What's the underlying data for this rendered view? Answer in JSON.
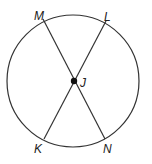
{
  "diagram": {
    "type": "circle-with-intersecting-chords",
    "circle": {
      "cx": 73,
      "cy": 81,
      "r": 66
    },
    "center_point": {
      "label": "J",
      "x": 74,
      "y": 81
    },
    "points": [
      {
        "label": "M",
        "x": 43,
        "y": 19,
        "lx": 34,
        "ly": 20
      },
      {
        "label": "L",
        "x": 106,
        "y": 21,
        "lx": 104,
        "ly": 21
      },
      {
        "label": "K",
        "x": 44,
        "y": 139,
        "lx": 34,
        "ly": 153
      },
      {
        "label": "N",
        "x": 105,
        "y": 139,
        "lx": 103,
        "ly": 153
      }
    ],
    "segments": [
      {
        "from": "M",
        "to": "N"
      },
      {
        "from": "L",
        "to": "K"
      }
    ],
    "labels": {
      "M": "M",
      "L": "L",
      "J": "J",
      "K": "K",
      "N": "N"
    },
    "colors": {
      "stroke": "#333333",
      "point": "#111111",
      "background": "#ffffff"
    }
  }
}
